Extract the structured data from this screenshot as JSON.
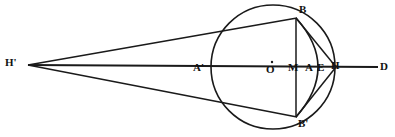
{
  "figure": {
    "stroke_color": "#1a1a1a",
    "label_color": "#111111",
    "background_color": "#ffffff",
    "width": 395,
    "height": 137
  },
  "labels": {
    "h_prime": "H'",
    "a_prime": "A'",
    "o": "O",
    "m": "M",
    "a": "A",
    "e": "E",
    "h": "H",
    "d": "D",
    "b": "B",
    "b_prime": "B'"
  },
  "geometry": {
    "circle": {
      "cx": 273,
      "cy": 67,
      "r": 62
    },
    "points": {
      "h_prime": {
        "x": 28,
        "y": 65
      },
      "a_prime": {
        "x": 211,
        "y": 67
      },
      "o": {
        "x": 273,
        "y": 67
      },
      "m": {
        "x": 296,
        "y": 67
      },
      "a": {
        "x": 313,
        "y": 67
      },
      "e": {
        "x": 324,
        "y": 67
      },
      "h": {
        "x": 335,
        "y": 67
      },
      "d": {
        "x": 378,
        "y": 67
      },
      "b": {
        "x": 296,
        "y": 18
      },
      "b_prime": {
        "x": 296,
        "y": 117
      }
    },
    "segments": [
      {
        "name": "axis-h-prime-to-d",
        "from": "h_prime",
        "to": "d"
      },
      {
        "name": "line-h-prime-to-b",
        "from": "h_prime",
        "to": "b"
      },
      {
        "name": "line-h-prime-to-b-prime",
        "from": "h_prime",
        "to": "b_prime"
      },
      {
        "name": "chord-b-to-b-prime",
        "from": "b",
        "to": "b_prime"
      },
      {
        "name": "line-b-to-h",
        "from": "b",
        "to": "h"
      },
      {
        "name": "line-b-prime-to-h",
        "from": "b_prime",
        "to": "h"
      }
    ],
    "arc_e": {
      "description": "arc bulging right through E from B to B-prime",
      "from": "b",
      "to": "b_prime",
      "through_x": 330
    },
    "center_dot": {
      "x": 272,
      "y": 62,
      "r": 1.1
    }
  },
  "label_positions": {
    "h_prime": {
      "left": 5,
      "top": 58
    },
    "a_prime": {
      "left": 194,
      "top": 62
    },
    "o": {
      "left": 266,
      "top": 64
    },
    "m": {
      "left": 290,
      "top": 62
    },
    "a": {
      "left": 306,
      "top": 62
    },
    "e": {
      "left": 318,
      "top": 62
    },
    "h": {
      "left": 332,
      "top": 60
    },
    "d": {
      "left": 381,
      "top": 61
    },
    "b": {
      "left": 299,
      "top": 4
    },
    "b_prime": {
      "left": 299,
      "top": 119
    }
  }
}
